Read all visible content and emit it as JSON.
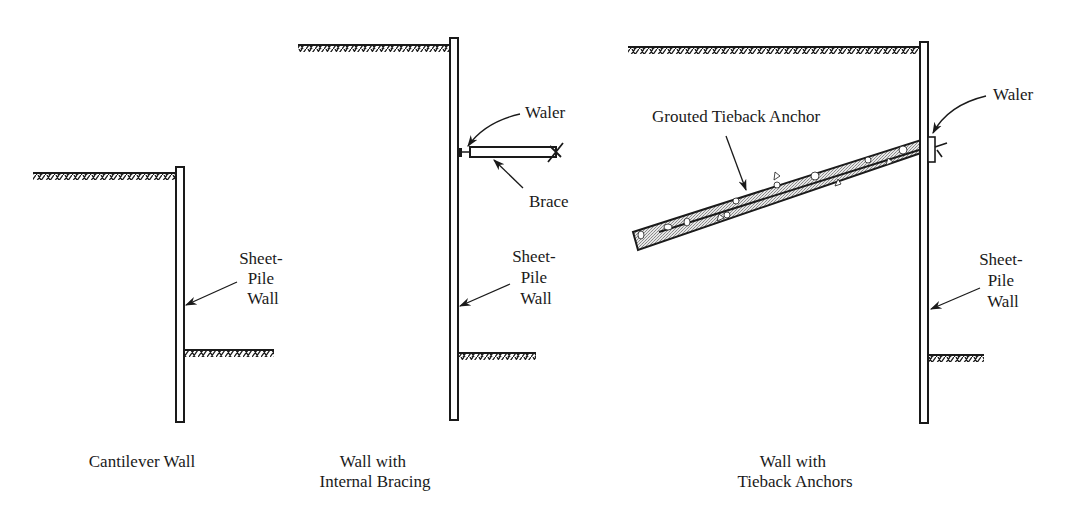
{
  "colors": {
    "ink": "#1a1a1a",
    "grout_fill": "#cfcfcf",
    "background": "#ffffff"
  },
  "panels": [
    {
      "id": "cantilever",
      "caption": [
        "Cantilever Wall"
      ],
      "labels": {
        "sheet_pile_wall": [
          "Sheet-",
          "Pile",
          "Wall"
        ]
      }
    },
    {
      "id": "internal-bracing",
      "caption": [
        "Wall with",
        "Internal Bracing"
      ],
      "labels": {
        "waler": "Waler",
        "brace": "Brace",
        "sheet_pile_wall": [
          "Sheet-",
          "Pile",
          "Wall"
        ]
      }
    },
    {
      "id": "tieback",
      "caption": [
        "Wall with",
        "Tieback Anchors"
      ],
      "labels": {
        "grouted_tieback_anchor": "Grouted Tieback Anchor",
        "waler": "Waler",
        "sheet_pile_wall": [
          "Sheet-",
          "Pile",
          "Wall"
        ]
      }
    }
  ]
}
